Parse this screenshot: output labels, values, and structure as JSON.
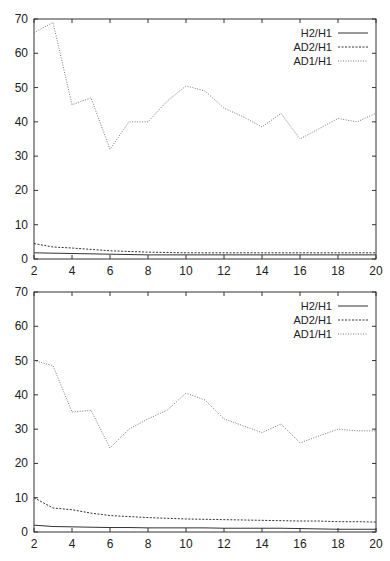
{
  "chart_data": [
    {
      "type": "line",
      "title": "",
      "xlabel": "",
      "ylabel": "",
      "xlim": [
        2,
        20
      ],
      "ylim": [
        0,
        70
      ],
      "xticks": [
        2,
        4,
        6,
        8,
        10,
        12,
        14,
        16,
        18,
        20
      ],
      "yticks": [
        0,
        10,
        20,
        30,
        40,
        50,
        60,
        70
      ],
      "grid": false,
      "legend_position": "upper right",
      "x": [
        2,
        3,
        4,
        5,
        6,
        7,
        8,
        9,
        10,
        11,
        12,
        13,
        14,
        15,
        16,
        17,
        18,
        19,
        20
      ],
      "series": [
        {
          "name": "H2/H1",
          "style": "solid",
          "values": [
            1.8,
            1.7,
            1.6,
            1.5,
            1.4,
            1.3,
            1.2,
            1.2,
            1.2,
            1.2,
            1.2,
            1.2,
            1.2,
            1.2,
            1.2,
            1.2,
            1.2,
            1.2,
            1.2
          ]
        },
        {
          "name": "AD2/H1",
          "style": "dashed",
          "values": [
            4.5,
            3.5,
            3.2,
            2.8,
            2.4,
            2.2,
            2.0,
            1.9,
            1.8,
            1.8,
            1.8,
            1.8,
            1.8,
            1.8,
            1.8,
            1.8,
            1.8,
            1.8,
            1.8
          ]
        },
        {
          "name": "AD1/H1",
          "style": "dotted",
          "values": [
            66,
            69,
            45,
            47,
            32,
            40,
            40,
            46,
            50.5,
            49,
            44,
            41.5,
            38.5,
            42.5,
            35,
            38,
            41,
            40,
            42.5
          ]
        }
      ]
    },
    {
      "type": "line",
      "title": "",
      "xlabel": "",
      "ylabel": "",
      "xlim": [
        2,
        20
      ],
      "ylim": [
        0,
        70
      ],
      "xticks": [
        2,
        4,
        6,
        8,
        10,
        12,
        14,
        16,
        18,
        20
      ],
      "yticks": [
        0,
        10,
        20,
        30,
        40,
        50,
        60,
        70
      ],
      "grid": false,
      "legend_position": "upper right",
      "x": [
        2,
        3,
        4,
        5,
        6,
        7,
        8,
        9,
        10,
        11,
        12,
        13,
        14,
        15,
        16,
        17,
        18,
        19,
        20
      ],
      "series": [
        {
          "name": "H2/H1",
          "style": "solid",
          "values": [
            2.0,
            1.6,
            1.5,
            1.4,
            1.3,
            1.3,
            1.2,
            1.2,
            1.2,
            1.2,
            1.1,
            1.1,
            1.1,
            1.1,
            1.0,
            0.9,
            0.8,
            0.8,
            0.8
          ]
        },
        {
          "name": "AD2/H1",
          "style": "dashed",
          "values": [
            10,
            7,
            6.5,
            5.5,
            4.8,
            4.5,
            4.2,
            4.0,
            3.8,
            3.7,
            3.6,
            3.5,
            3.4,
            3.3,
            3.2,
            3.2,
            3.0,
            3.0,
            2.9
          ]
        },
        {
          "name": "AD1/H1",
          "style": "dotted",
          "values": [
            50,
            48.5,
            35,
            35.5,
            24.5,
            30,
            33,
            35.5,
            40.5,
            38.5,
            33,
            31,
            29,
            31.5,
            26,
            28,
            30,
            29.5,
            29.5
          ]
        }
      ]
    }
  ],
  "style": {
    "axis_color": "#333333",
    "line_color": "#333333",
    "dotted_color": "#777777"
  }
}
